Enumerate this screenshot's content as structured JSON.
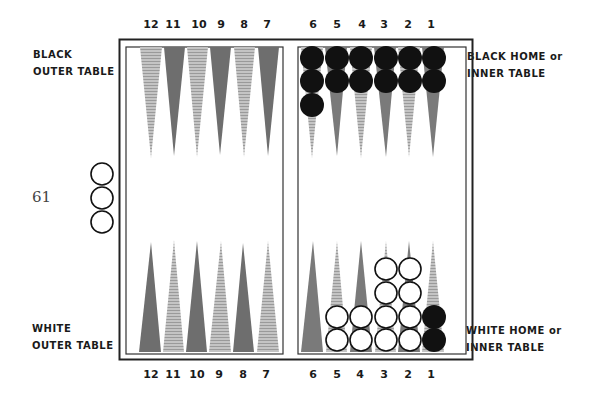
{
  "page_number": "61",
  "labels": {
    "black_outer": [
      "BLACK",
      "OUTER TABLE"
    ],
    "black_home": [
      "BLACK HOME or",
      "INNER TABLE"
    ],
    "white_outer": [
      "WHITE",
      "OUTER TABLE"
    ],
    "white_home": [
      "WHITE HOME or",
      "INNER TABLE"
    ]
  },
  "top_point_numbers": [
    "12",
    "11",
    "10",
    "9",
    "8",
    "7",
    "6",
    "5",
    "4",
    "3",
    "2",
    "1"
  ],
  "bottom_point_numbers": [
    "12",
    "11",
    "10",
    "9",
    "8",
    "7",
    "6",
    "5",
    "4",
    "3",
    "2",
    "1"
  ],
  "colors": {
    "dark_point": "#6e6e6e",
    "light_point": "#b4b4b4",
    "black_checker": "#111111",
    "white_checker": "#ffffff",
    "board_line": "#222222"
  },
  "checkers": {
    "black_top": [
      {
        "point": "6",
        "count": 3
      },
      {
        "point": "5",
        "count": 2
      },
      {
        "point": "4",
        "count": 2
      },
      {
        "point": "3",
        "count": 2
      },
      {
        "point": "2",
        "count": 2
      },
      {
        "point": "1",
        "count": 2
      }
    ],
    "white_bottom": [
      {
        "point": "5",
        "count": 2
      },
      {
        "point": "4",
        "count": 2
      },
      {
        "point": "3",
        "count": 4
      },
      {
        "point": "2",
        "count": 4
      }
    ],
    "black_bottom": [
      {
        "point": "1",
        "count": 2
      }
    ],
    "white_off_board": 3
  }
}
